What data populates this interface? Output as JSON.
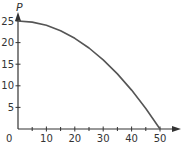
{
  "chart_data": {
    "type": "line",
    "title": "",
    "xlabel": "",
    "ylabel": "P",
    "xlim": [
      0,
      55
    ],
    "ylim": [
      0,
      27
    ],
    "x_ticks": [
      0,
      10,
      20,
      30,
      40,
      50
    ],
    "x_minor_ticks": [
      5,
      15,
      25,
      35,
      45
    ],
    "y_ticks": [
      5,
      10,
      15,
      20,
      25
    ],
    "origin_label": "0",
    "grid": false,
    "legend": null,
    "series": [
      {
        "name": "P",
        "x": [
          0,
          5,
          10,
          15,
          20,
          25,
          30,
          35,
          40,
          45,
          50
        ],
        "values": [
          25,
          24.75,
          24,
          22.75,
          21,
          18.75,
          16,
          12.75,
          9,
          4.75,
          0
        ]
      }
    ],
    "colors": {
      "axis": "#333333",
      "curve": "#555555"
    }
  }
}
